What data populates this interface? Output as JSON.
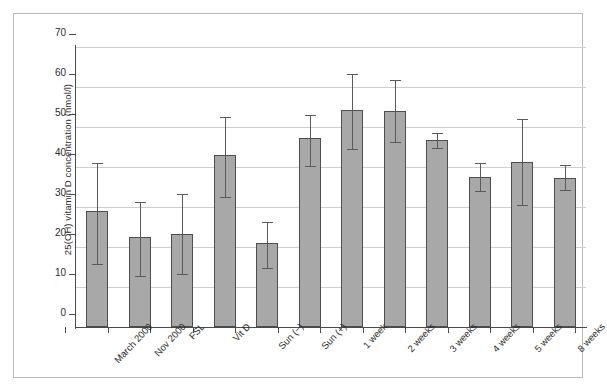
{
  "chart_data": {
    "type": "bar",
    "title": "",
    "subtitle": "",
    "xlabel": "",
    "ylabel": "25(OH) vitamin D concentration (nmol/l)",
    "ylim": [
      0,
      70
    ],
    "yticks": [
      0,
      10,
      20,
      30,
      40,
      50,
      60,
      70
    ],
    "ytick_labels": [
      "0",
      "10",
      "20",
      "30",
      "40",
      "50",
      "60",
      "70"
    ],
    "grid": true,
    "legend": false,
    "legend_position": "none",
    "error_bars": true,
    "error_bar_style": "capped-range",
    "bar_color": "#a8a8a8",
    "bar_edge_color": "#4e4e4e",
    "error_bar_color": "#5a5a5a",
    "gridline_color": "#cfcfcf",
    "axis_color": "#4a4a4a",
    "categories": [
      "March 2000",
      "Nov 2000",
      "FSL",
      "Vit D",
      "Sun (−)",
      "Sun (+)",
      "1 week",
      "2 weeks",
      "3 weeks",
      "4 weeks",
      "5 weeks",
      "8 weeks"
    ],
    "values": [
      29.0,
      22.5,
      23.3,
      43.0,
      21.0,
      47.3,
      54.2,
      54.0,
      46.8,
      37.5,
      41.3,
      37.3
    ],
    "error_low": [
      15.8,
      12.8,
      13.3,
      32.5,
      14.8,
      40.3,
      44.5,
      46.3,
      44.8,
      34.0,
      30.5,
      34.3
    ],
    "error_high": [
      41.0,
      31.3,
      33.3,
      52.5,
      26.3,
      53.0,
      63.3,
      61.8,
      48.5,
      41.0,
      52.0,
      40.5
    ],
    "series": [
      {
        "name": "25(OH)D",
        "values": [
          29.0,
          22.5,
          23.3,
          43.0,
          21.0,
          47.3,
          54.2,
          54.0,
          46.8,
          37.5,
          41.3,
          37.3
        ]
      }
    ]
  }
}
